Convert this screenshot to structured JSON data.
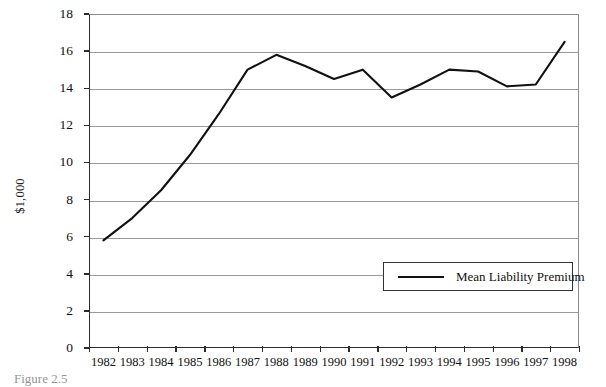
{
  "chart_data": {
    "type": "line",
    "title": "",
    "xlabel": "",
    "ylabel": "$1,000",
    "ylim": [
      0,
      18
    ],
    "ytick_step": 2,
    "yticks": [
      "0",
      "2",
      "4",
      "6",
      "8",
      "10",
      "12",
      "14",
      "16",
      "18"
    ],
    "grid": true,
    "legend_position": "inside lower-right",
    "categories": [
      "1982",
      "1983",
      "1984",
      "1985",
      "1986",
      "1987",
      "1988",
      "1989",
      "1990",
      "1991",
      "1992",
      "1993",
      "1994",
      "1995",
      "1996",
      "1997",
      "1998"
    ],
    "series": [
      {
        "name": "Mean Liability Premium",
        "color": "#111111",
        "values": [
          5.8,
          7.0,
          8.5,
          10.4,
          12.6,
          15.0,
          15.8,
          15.2,
          14.5,
          15.0,
          13.5,
          14.2,
          15.0,
          14.9,
          14.1,
          14.2,
          16.5
        ]
      }
    ]
  },
  "axis": {
    "y_title": "$1,000"
  },
  "legend": {
    "entries": [
      {
        "label": "Mean Liability Premium"
      }
    ]
  },
  "caption": {
    "text": "Figure 2.5"
  }
}
